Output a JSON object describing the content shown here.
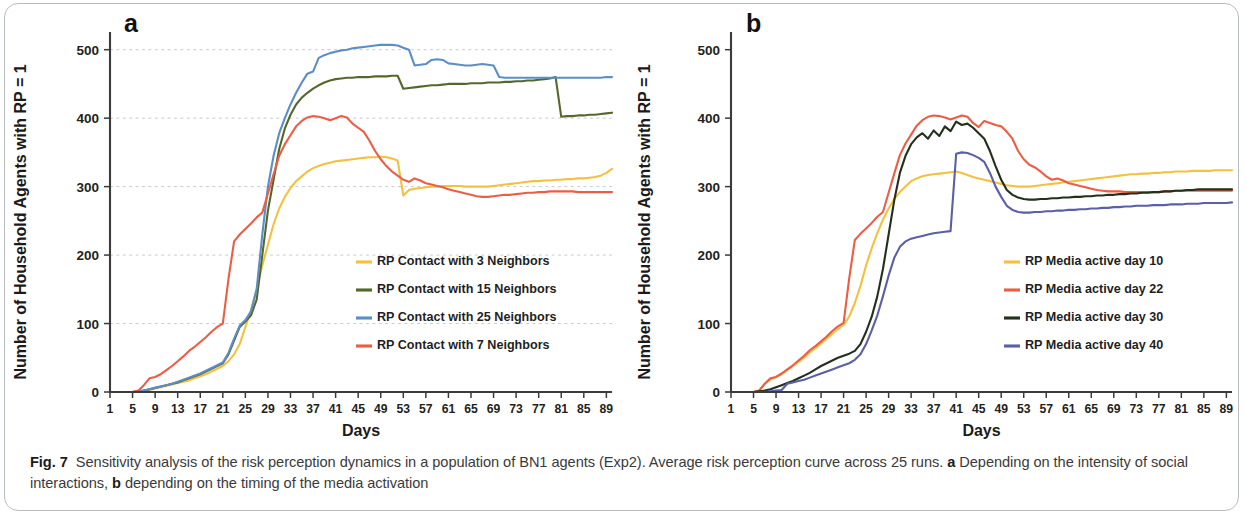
{
  "figure": {
    "caption_label": "Fig. 7",
    "caption_text_1": "Sensitivity analysis of the risk perception dynamics in a population of BN1 agents (Exp2). Average risk perception curve across 25 runs. ",
    "caption_bold_a": "a",
    "caption_text_2": " Depending on the intensity of social interactions, ",
    "caption_bold_b": "b",
    "caption_text_3": " depending on the timing of the media activation"
  },
  "colors": {
    "yellow": "#f3c13f",
    "red": "#eb5e46",
    "green": "#55682c",
    "blue": "#5b8ec6",
    "darkgreen": "#22301c",
    "purple": "#5a5fa8",
    "axis": "#3b3b3b",
    "grid": "#c9cbcd"
  },
  "chart_data": [
    {
      "type": "line",
      "panel": "a",
      "title": "",
      "xlabel": "Days",
      "ylabel": "Number of Household Agents with RP = 1",
      "xlim": [
        1,
        90
      ],
      "ylim": [
        0,
        520
      ],
      "yticks": [
        0,
        100,
        200,
        300,
        400,
        500
      ],
      "xticks": [
        1,
        5,
        9,
        13,
        17,
        21,
        25,
        29,
        33,
        37,
        41,
        45,
        49,
        53,
        57,
        61,
        65,
        69,
        73,
        77,
        81,
        85,
        89
      ],
      "grid": true,
      "legend_position": "inside-center",
      "x": [
        1,
        2,
        3,
        4,
        5,
        6,
        7,
        8,
        9,
        10,
        11,
        12,
        13,
        14,
        15,
        16,
        17,
        18,
        19,
        20,
        21,
        22,
        23,
        24,
        25,
        26,
        27,
        28,
        29,
        30,
        31,
        32,
        33,
        34,
        35,
        36,
        37,
        38,
        39,
        40,
        41,
        42,
        43,
        44,
        45,
        46,
        47,
        48,
        49,
        50,
        51,
        52,
        53,
        54,
        55,
        56,
        57,
        58,
        59,
        60,
        61,
        62,
        63,
        64,
        65,
        66,
        67,
        68,
        69,
        70,
        71,
        72,
        73,
        74,
        75,
        76,
        77,
        78,
        79,
        80,
        81,
        82,
        83,
        84,
        85,
        86,
        87,
        88,
        89,
        90
      ],
      "series": [
        {
          "name": "RP Contact with 3 Neighbors",
          "color": "#f3c13f",
          "values": [
            0,
            0,
            0,
            0,
            0,
            1,
            2,
            3,
            5,
            7,
            9,
            11,
            13,
            15,
            17,
            20,
            23,
            26,
            30,
            34,
            38,
            45,
            55,
            70,
            95,
            120,
            150,
            185,
            215,
            245,
            268,
            285,
            298,
            308,
            315,
            322,
            327,
            330,
            333,
            335,
            337,
            338,
            339,
            340,
            341,
            342,
            343,
            343,
            344,
            343,
            341,
            338,
            287,
            295,
            297,
            298,
            299,
            300,
            300,
            301,
            301,
            301,
            301,
            300,
            300,
            300,
            300,
            300,
            301,
            302,
            303,
            304,
            305,
            306,
            307,
            308,
            308,
            309,
            309,
            310,
            310,
            311,
            311,
            312,
            312,
            313,
            314,
            316,
            320,
            326
          ]
        },
        {
          "name": "RP Contact with 15 Neighbors",
          "color": "#55682c",
          "values": [
            0,
            0,
            0,
            0,
            0,
            1,
            2,
            4,
            6,
            8,
            10,
            12,
            14,
            17,
            20,
            23,
            26,
            30,
            34,
            38,
            42,
            55,
            75,
            95,
            103,
            112,
            135,
            200,
            265,
            310,
            355,
            385,
            405,
            420,
            430,
            437,
            443,
            448,
            452,
            455,
            457,
            458,
            459,
            459,
            460,
            460,
            460,
            461,
            461,
            461,
            462,
            462,
            443,
            444,
            445,
            446,
            447,
            448,
            448,
            449,
            450,
            450,
            450,
            450,
            451,
            451,
            451,
            452,
            452,
            452,
            453,
            453,
            454,
            454,
            455,
            455,
            456,
            457,
            458,
            460,
            402,
            403,
            403,
            404,
            404,
            405,
            405,
            406,
            407,
            408
          ]
        },
        {
          "name": "RP Contact with 25 Neighbors",
          "color": "#5b8ec6",
          "values": [
            0,
            0,
            0,
            0,
            0,
            1,
            2,
            4,
            6,
            8,
            10,
            12,
            15,
            18,
            21,
            24,
            27,
            31,
            35,
            39,
            43,
            57,
            78,
            97,
            105,
            118,
            150,
            230,
            300,
            345,
            378,
            400,
            420,
            437,
            452,
            465,
            468,
            488,
            492,
            495,
            497,
            499,
            500,
            502,
            503,
            504,
            505,
            506,
            507,
            507,
            507,
            506,
            503,
            500,
            477,
            478,
            479,
            485,
            486,
            485,
            480,
            479,
            478,
            477,
            477,
            478,
            479,
            478,
            477,
            460,
            459,
            459,
            459,
            459,
            459,
            459,
            459,
            459,
            459,
            459,
            459,
            459,
            459,
            459,
            459,
            459,
            459,
            459,
            460,
            460
          ]
        },
        {
          "name": "RP  Contact with 7 Neighbors",
          "color": "#eb5e46",
          "values": [
            0,
            0,
            0,
            0,
            0,
            2,
            10,
            20,
            22,
            26,
            32,
            38,
            45,
            52,
            60,
            66,
            73,
            80,
            88,
            95,
            100,
            165,
            220,
            230,
            238,
            246,
            255,
            262,
            290,
            318,
            345,
            362,
            375,
            388,
            396,
            401,
            403,
            402,
            400,
            397,
            400,
            403,
            401,
            392,
            386,
            380,
            367,
            352,
            340,
            330,
            322,
            316,
            310,
            307,
            312,
            309,
            305,
            303,
            301,
            299,
            296,
            294,
            292,
            290,
            288,
            286,
            285,
            285,
            286,
            287,
            288,
            288,
            289,
            290,
            291,
            291,
            292,
            292,
            293,
            293,
            293,
            293,
            293,
            292,
            292,
            292,
            292,
            292,
            292,
            292
          ]
        }
      ]
    },
    {
      "type": "line",
      "panel": "b",
      "title": "",
      "xlabel": "Days",
      "ylabel": "Number of Household Agents with RP = 1",
      "xlim": [
        1,
        90
      ],
      "ylim": [
        0,
        520
      ],
      "yticks": [
        0,
        100,
        200,
        300,
        400,
        500
      ],
      "xticks": [
        1,
        5,
        9,
        13,
        17,
        21,
        25,
        29,
        33,
        37,
        41,
        45,
        49,
        53,
        57,
        61,
        65,
        69,
        73,
        77,
        81,
        85,
        89
      ],
      "grid": false,
      "legend_position": "inside-center",
      "x": [
        1,
        2,
        3,
        4,
        5,
        6,
        7,
        8,
        9,
        10,
        11,
        12,
        13,
        14,
        15,
        16,
        17,
        18,
        19,
        20,
        21,
        22,
        23,
        24,
        25,
        26,
        27,
        28,
        29,
        30,
        31,
        32,
        33,
        34,
        35,
        36,
        37,
        38,
        39,
        40,
        41,
        42,
        43,
        44,
        45,
        46,
        47,
        48,
        49,
        50,
        51,
        52,
        53,
        54,
        55,
        56,
        57,
        58,
        59,
        60,
        61,
        62,
        63,
        64,
        65,
        66,
        67,
        68,
        69,
        70,
        71,
        72,
        73,
        74,
        75,
        76,
        77,
        78,
        79,
        80,
        81,
        82,
        83,
        84,
        85,
        86,
        87,
        88,
        89,
        90
      ],
      "series": [
        {
          "name": "RP Media active day 10",
          "color": "#f3c13f",
          "values": [
            0,
            0,
            0,
            0,
            0,
            2,
            12,
            18,
            22,
            26,
            32,
            38,
            44,
            50,
            58,
            64,
            71,
            78,
            85,
            92,
            98,
            110,
            130,
            155,
            185,
            210,
            232,
            252,
            268,
            282,
            292,
            300,
            308,
            312,
            315,
            317,
            318,
            319,
            320,
            321,
            322,
            320,
            317,
            314,
            312,
            310,
            308,
            306,
            304,
            302,
            301,
            300,
            300,
            300,
            301,
            302,
            303,
            304,
            305,
            306,
            307,
            308,
            309,
            310,
            311,
            312,
            313,
            314,
            315,
            316,
            317,
            318,
            318,
            319,
            319,
            320,
            320,
            321,
            321,
            322,
            322,
            322,
            323,
            323,
            323,
            323,
            324,
            324,
            324,
            324
          ]
        },
        {
          "name": "RP Media active day 22",
          "color": "#eb5e46",
          "values": [
            0,
            0,
            0,
            0,
            0,
            2,
            12,
            20,
            22,
            27,
            33,
            39,
            46,
            53,
            61,
            67,
            74,
            81,
            89,
            96,
            101,
            166,
            222,
            231,
            239,
            247,
            256,
            263,
            291,
            319,
            346,
            363,
            376,
            389,
            397,
            402,
            404,
            403,
            401,
            398,
            401,
            404,
            402,
            393,
            387,
            396,
            393,
            390,
            388,
            380,
            370,
            352,
            340,
            332,
            328,
            322,
            315,
            310,
            312,
            309,
            305,
            303,
            301,
            299,
            297,
            295,
            294,
            293,
            293,
            293,
            292,
            292,
            292,
            292,
            292,
            292,
            292,
            293,
            293,
            294,
            294,
            294,
            294,
            294,
            294,
            294,
            294,
            294,
            294,
            294
          ]
        },
        {
          "name": "RP Media active day 30",
          "color": "#22301c",
          "values": [
            0,
            0,
            0,
            0,
            0,
            1,
            2,
            4,
            7,
            10,
            13,
            16,
            20,
            24,
            28,
            33,
            38,
            42,
            46,
            50,
            53,
            56,
            60,
            70,
            88,
            110,
            140,
            180,
            230,
            280,
            320,
            345,
            362,
            372,
            378,
            370,
            382,
            374,
            388,
            381,
            395,
            390,
            392,
            386,
            378,
            370,
            352,
            330,
            310,
            295,
            288,
            284,
            282,
            281,
            281,
            282,
            282,
            283,
            283,
            284,
            284,
            285,
            285,
            286,
            286,
            287,
            287,
            288,
            288,
            289,
            289,
            290,
            290,
            291,
            291,
            292,
            292,
            293,
            293,
            294,
            294,
            295,
            295,
            296,
            296,
            296,
            296,
            296,
            296,
            296
          ]
        },
        {
          "name": "RP Media active day 40",
          "color": "#5a5fa8",
          "values": [
            0,
            0,
            0,
            0,
            0,
            0,
            0,
            1,
            2,
            3,
            12,
            14,
            16,
            18,
            21,
            24,
            27,
            30,
            33,
            36,
            39,
            42,
            47,
            55,
            70,
            90,
            112,
            140,
            170,
            196,
            212,
            220,
            224,
            226,
            228,
            230,
            232,
            233,
            234,
            235,
            348,
            350,
            349,
            346,
            342,
            336,
            320,
            300,
            285,
            272,
            266,
            263,
            262,
            262,
            263,
            263,
            264,
            264,
            265,
            265,
            266,
            266,
            267,
            267,
            268,
            268,
            269,
            269,
            270,
            270,
            271,
            271,
            272,
            272,
            272,
            273,
            273,
            273,
            274,
            274,
            274,
            275,
            275,
            275,
            276,
            276,
            276,
            276,
            276,
            277
          ]
        }
      ]
    }
  ]
}
